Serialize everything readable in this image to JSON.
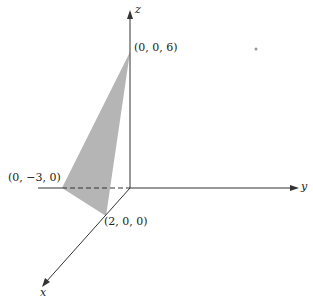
{
  "diagram": {
    "type": "3d-coordinate-axes-with-plane-triangle",
    "axes": {
      "x_label": "x",
      "y_label": "y",
      "z_label": "z"
    },
    "points": [
      {
        "name": "z-intercept",
        "label": "(0, 0, 6)"
      },
      {
        "name": "y-intercept",
        "label": "(0, −3, 0)"
      },
      {
        "name": "x-intercept",
        "label": "(2, 0, 0)"
      }
    ],
    "colors": {
      "triangle_fill": "#b3b3b3",
      "axis": "#333333"
    }
  }
}
